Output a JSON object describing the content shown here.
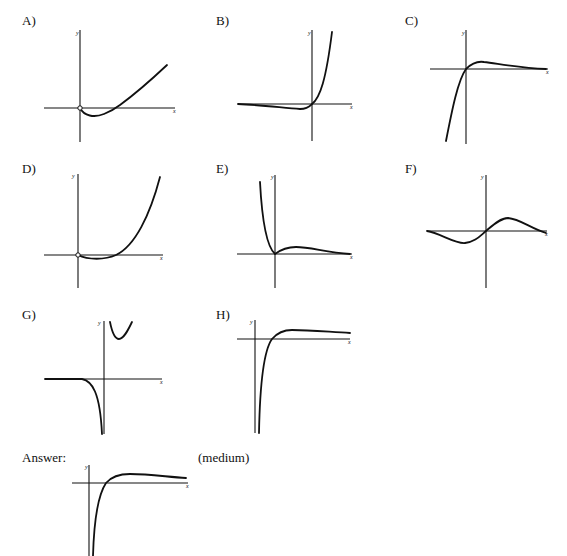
{
  "panels": [
    {
      "id": "A",
      "label": "A)",
      "description": "curve from origin (open circle) dips below x-axis then rises increasing to upper right"
    },
    {
      "id": "B",
      "label": "B)",
      "description": "flat near zero on left, slight dip below axis, passes through origin and rises steeply"
    },
    {
      "id": "C",
      "label": "C)",
      "description": "rises steeply from bottom-left through origin, small hump above axis, decays to zero"
    },
    {
      "id": "D",
      "label": "D)",
      "description": "open circle at origin, small dip below x-axis, then rises steeply"
    },
    {
      "id": "E",
      "label": "E)",
      "description": "steep decrease from top-left to origin, small hump on right decaying to zero"
    },
    {
      "id": "F",
      "label": "F)",
      "description": "odd function: trough on left, peak on right, decaying to zero on both sides"
    },
    {
      "id": "G",
      "label": "G)",
      "description": "vertical asymptote at x=0; left branch flat then plunges down; right branch U-shaped above"
    },
    {
      "id": "H",
      "label": "H)",
      "description": "rises from negative infinity near x=0, crosses x-axis, slight peak, levels toward a positive asymptote"
    }
  ],
  "answer": {
    "label": "Answer:",
    "difficulty": "(medium)",
    "graph": "H"
  },
  "axis_labels": {
    "x": "x",
    "y": "y"
  }
}
